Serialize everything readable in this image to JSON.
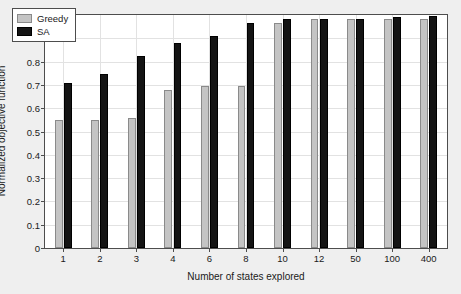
{
  "chart_data": {
    "type": "bar",
    "title": "",
    "xlabel": "Number of states explored",
    "ylabel": "Normalized objective function",
    "categories": [
      "1",
      "2",
      "3",
      "4",
      "6",
      "8",
      "10",
      "12",
      "50",
      "100",
      "400"
    ],
    "series": [
      {
        "name": "Greedy",
        "color": "#c4c4c4",
        "values": [
          0.55,
          0.55,
          0.56,
          0.68,
          0.695,
          0.695,
          0.965,
          0.985,
          0.985,
          0.985,
          0.985
        ]
      },
      {
        "name": "SA",
        "color": "#141414",
        "values": [
          0.71,
          0.745,
          0.825,
          0.88,
          0.91,
          0.965,
          0.985,
          0.985,
          0.985,
          0.99,
          0.995
        ]
      }
    ],
    "ylim": [
      0,
      1
    ],
    "yticks": [
      "0",
      "0.1",
      "0.2",
      "0.3",
      "0.4",
      "0.5",
      "0.6",
      "0.7",
      "0.8",
      "0.9",
      "1"
    ],
    "ytick_values": [
      0,
      0.1,
      0.2,
      0.3,
      0.4,
      0.5,
      0.6,
      0.7,
      0.8,
      0.9,
      1
    ],
    "grid": true,
    "legend_position": "top-left",
    "legend_entries": [
      "Greedy",
      "SA"
    ]
  },
  "figure": {
    "background_color": "#efefef",
    "plot_background_color": "#ffffff",
    "axis_color": "#4d4d4d",
    "grid_color": "#e2e2e2"
  }
}
